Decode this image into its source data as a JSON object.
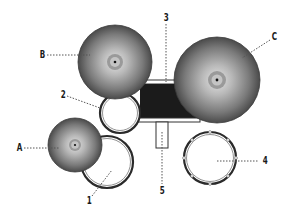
{
  "diagram": {
    "type": "drum-kit-top-view",
    "colors": {
      "background": "#ffffff",
      "cymbal_light": "#d9d9d9",
      "cymbal_dark": "#4a4a4a",
      "bass_drum": "#1b1b1b",
      "drum_ring": "#3a3a3a",
      "leader_line": "#555555"
    },
    "cymbals": [
      {
        "id": "A",
        "label": "A",
        "cx": 75,
        "cy": 145,
        "r": 27
      },
      {
        "id": "B",
        "label": "B",
        "cx": 115,
        "cy": 62,
        "r": 37
      },
      {
        "id": "C",
        "label": "C",
        "cx": 217,
        "cy": 80,
        "r": 43
      }
    ],
    "drums": [
      {
        "id": "1",
        "label": "1",
        "cx": 107,
        "cy": 162,
        "r": 26
      },
      {
        "id": "2",
        "label": "2",
        "cx": 120,
        "cy": 113,
        "r": 20
      },
      {
        "id": "4",
        "label": "4",
        "cx": 210,
        "cy": 158,
        "r": 26
      }
    ],
    "bass_drum": {
      "id": "3",
      "label": "3"
    },
    "pedal": {
      "id": "5",
      "label": "5"
    },
    "labels": {
      "A": "A",
      "B": "B",
      "C": "C",
      "one": "1",
      "two": "2",
      "three": "3",
      "four": "4",
      "five": "5"
    }
  }
}
